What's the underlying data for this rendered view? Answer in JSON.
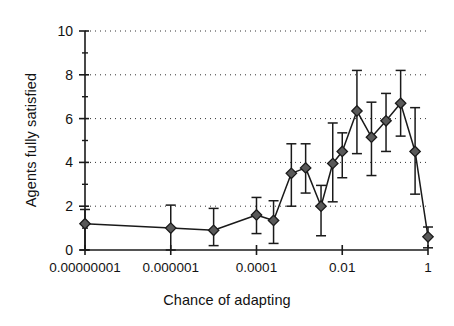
{
  "chart_data": {
    "type": "line",
    "title": "",
    "subtitle": "",
    "xlabel": "Chance of adapting",
    "ylabel": "Agents fully satisfied",
    "xscale": "log",
    "xlim": [
      1e-08,
      1
    ],
    "ylim": [
      0,
      10
    ],
    "grid": "horizontal-dotted",
    "legend": null,
    "marker": "diamond",
    "error_bars": true,
    "xticklabels": [
      "0.00000001",
      "0.000001",
      "0.0001",
      "0.01",
      "1"
    ],
    "xtickvalues": [
      1e-08,
      1e-06,
      0.0001,
      0.01,
      1
    ],
    "yticklabels": [
      "0",
      "2",
      "4",
      "6",
      "8",
      "10"
    ],
    "ytickvalues": [
      0,
      2,
      4,
      6,
      8,
      10
    ],
    "series": [
      {
        "name": "Agents fully satisfied",
        "color": "#595959",
        "points": [
          {
            "x": 1e-08,
            "y": 1.2,
            "yerr_low": 1.2,
            "yerr_high": 0.65
          },
          {
            "x": 1e-06,
            "y": 1.0,
            "yerr_low": 1.0,
            "yerr_high": 1.05
          },
          {
            "x": 1e-05,
            "y": 0.9,
            "yerr_low": 0.7,
            "yerr_high": 1.0
          },
          {
            "x": 0.0001,
            "y": 1.6,
            "yerr_low": 0.85,
            "yerr_high": 0.8
          },
          {
            "x": 0.00025,
            "y": 1.35,
            "yerr_low": 1.05,
            "yerr_high": 0.9
          },
          {
            "x": 0.00065,
            "y": 3.5,
            "yerr_low": 1.5,
            "yerr_high": 1.35
          },
          {
            "x": 0.0014,
            "y": 3.75,
            "yerr_low": 1.15,
            "yerr_high": 1.1
          },
          {
            "x": 0.0032,
            "y": 2.0,
            "yerr_low": 1.35,
            "yerr_high": 0.95
          },
          {
            "x": 0.006,
            "y": 3.95,
            "yerr_low": 1.75,
            "yerr_high": 1.85
          },
          {
            "x": 0.01,
            "y": 4.5,
            "yerr_low": 1.2,
            "yerr_high": 0.85
          },
          {
            "x": 0.022,
            "y": 6.35,
            "yerr_low": 1.95,
            "yerr_high": 1.85
          },
          {
            "x": 0.048,
            "y": 5.15,
            "yerr_low": 1.75,
            "yerr_high": 1.6
          },
          {
            "x": 0.105,
            "y": 5.9,
            "yerr_low": 1.4,
            "yerr_high": 1.25
          },
          {
            "x": 0.23,
            "y": 6.7,
            "yerr_low": 1.5,
            "yerr_high": 1.5
          },
          {
            "x": 0.5,
            "y": 4.5,
            "yerr_low": 1.95,
            "yerr_high": 2.0
          },
          {
            "x": 1.0,
            "y": 0.6,
            "yerr_low": 0.5,
            "yerr_high": 0.45
          }
        ]
      }
    ]
  },
  "axes": {
    "x_title": "Chance of adapting",
    "y_title": "Agents fully satisfied"
  }
}
